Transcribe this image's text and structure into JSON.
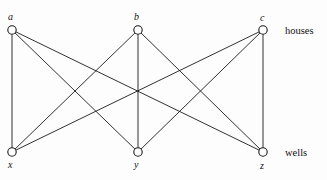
{
  "figure": {
    "background_color": "#fdfdfd",
    "stroke_color": "#1a1a1a",
    "node_fill": "#ffffff",
    "width": 327,
    "height": 180
  },
  "chart_data": {
    "type": "diagram",
    "diagram_kind": "bipartite-graph",
    "title": "",
    "node_radius": 4.2,
    "top_row_label": "houses",
    "bottom_row_label": "wells",
    "nodes": [
      {
        "id": "a",
        "label": "a",
        "group": "houses",
        "x": 12,
        "y": 30,
        "label_x": 8,
        "label_y": 12
      },
      {
        "id": "b",
        "label": "b",
        "group": "houses",
        "x": 138,
        "y": 30,
        "label_x": 134,
        "label_y": 12
      },
      {
        "id": "c",
        "label": "c",
        "group": "houses",
        "x": 263,
        "y": 30,
        "label_x": 260,
        "label_y": 13
      },
      {
        "id": "x",
        "label": "x",
        "group": "wells",
        "x": 12,
        "y": 152,
        "label_x": 8,
        "label_y": 160
      },
      {
        "id": "y",
        "label": "y",
        "group": "wells",
        "x": 138,
        "y": 152,
        "label_x": 134,
        "label_y": 160
      },
      {
        "id": "z",
        "label": "z",
        "group": "wells",
        "x": 263,
        "y": 152,
        "label_x": 260,
        "label_y": 161
      }
    ],
    "edges": [
      {
        "from": "a",
        "to": "x"
      },
      {
        "from": "a",
        "to": "y"
      },
      {
        "from": "a",
        "to": "z"
      },
      {
        "from": "b",
        "to": "x"
      },
      {
        "from": "b",
        "to": "y"
      },
      {
        "from": "b",
        "to": "z"
      },
      {
        "from": "c",
        "to": "x"
      },
      {
        "from": "c",
        "to": "y"
      },
      {
        "from": "c",
        "to": "z"
      }
    ],
    "edge_count": 9,
    "node_count": 6
  },
  "annotations": {
    "houses": {
      "text": "houses",
      "x": 285,
      "y": 26
    },
    "wells": {
      "text": "wells",
      "x": 285,
      "y": 148
    }
  }
}
